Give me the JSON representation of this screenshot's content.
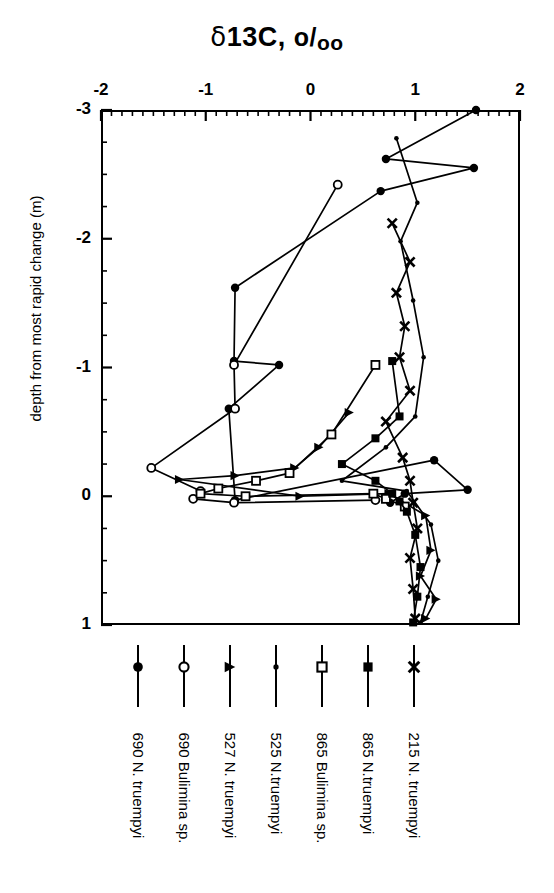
{
  "chart_data": {
    "type": "line",
    "title": "δ13C, o/oo",
    "title_parts": {
      "delta": "δ",
      "main": "13C, ",
      "permil_num": "o",
      "permil_slash": "/",
      "permil_den": "oo"
    },
    "xlabel": "δ13C, o/oo",
    "ylabel": "depth from most rapid change (m)",
    "xlim": [
      -2,
      2
    ],
    "ylim": [
      1,
      -3
    ],
    "x_ticks": [
      -2,
      -1,
      0,
      1,
      2
    ],
    "x_tick_labels": [
      "-2",
      "-1",
      "0",
      "1",
      "2"
    ],
    "x_minor_step": 0.1,
    "y_ticks": [
      -3,
      -2,
      -1,
      0,
      1
    ],
    "y_tick_labels": [
      "-3",
      "-2",
      "-1",
      "0",
      "1"
    ],
    "y_minor_step": 0.25,
    "x_axis_position": "top",
    "grid": false,
    "legend_position": "below",
    "series": [
      {
        "name": "690 N. truempyi",
        "marker": "filled-circle",
        "points": [
          [
            1.58,
            -3.0
          ],
          [
            0.72,
            -2.62
          ],
          [
            1.56,
            -2.55
          ],
          [
            0.67,
            -2.37
          ],
          [
            -0.72,
            -1.62
          ],
          [
            -0.73,
            -1.05
          ],
          [
            -0.3,
            -1.02
          ],
          [
            -0.78,
            -0.68
          ],
          [
            -0.72,
            0.03
          ],
          [
            1.18,
            -0.28
          ],
          [
            1.5,
            -0.05
          ],
          [
            0.9,
            -0.02
          ],
          [
            0.76,
            0.05
          ]
        ]
      },
      {
        "name": "690 Bulimina sp.",
        "marker": "open-circle",
        "points": [
          [
            0.26,
            -2.42
          ],
          [
            -0.73,
            -1.02
          ],
          [
            -0.72,
            -0.68
          ],
          [
            -1.52,
            -0.22
          ],
          [
            -1.05,
            -0.04
          ],
          [
            -1.12,
            0.02
          ],
          [
            -0.73,
            0.05
          ],
          [
            0.62,
            0.03
          ]
        ]
      },
      {
        "name": "527 N. truempyi",
        "marker": "triangle-right",
        "points": [
          [
            0.37,
            -0.65
          ],
          [
            0.08,
            -0.38
          ],
          [
            -0.15,
            -0.22
          ],
          [
            -0.72,
            -0.16
          ],
          [
            -1.25,
            -0.13
          ],
          [
            -0.1,
            0.0
          ],
          [
            0.75,
            -0.02
          ],
          [
            1.1,
            0.15
          ],
          [
            1.15,
            0.42
          ],
          [
            1.05,
            0.62
          ],
          [
            1.2,
            0.8
          ],
          [
            1.1,
            0.95
          ]
        ]
      },
      {
        "name": "525 N.truempyi",
        "marker": "small-dot",
        "points": [
          [
            0.82,
            -2.78
          ],
          [
            1.02,
            -2.28
          ],
          [
            0.86,
            -1.98
          ],
          [
            0.98,
            -1.52
          ],
          [
            1.08,
            -1.08
          ],
          [
            1.0,
            -0.62
          ],
          [
            0.72,
            -0.38
          ],
          [
            0.3,
            -0.12
          ],
          [
            0.92,
            -0.04
          ],
          [
            1.15,
            0.22
          ],
          [
            1.22,
            0.5
          ],
          [
            1.12,
            0.78
          ],
          [
            1.05,
            0.98
          ]
        ]
      },
      {
        "name": "865 Bulimina sp.",
        "marker": "open-square",
        "points": [
          [
            0.62,
            -1.02
          ],
          [
            0.2,
            -0.48
          ],
          [
            -0.2,
            -0.18
          ],
          [
            -0.52,
            -0.12
          ],
          [
            -0.88,
            -0.06
          ],
          [
            -1.05,
            -0.02
          ],
          [
            -0.62,
            0.0
          ],
          [
            0.6,
            -0.02
          ],
          [
            0.72,
            0.02
          ],
          [
            0.9,
            0.08
          ]
        ]
      },
      {
        "name": "865 N.truempyi",
        "marker": "filled-square",
        "points": [
          [
            0.78,
            -1.05
          ],
          [
            0.85,
            -0.62
          ],
          [
            0.62,
            -0.45
          ],
          [
            0.3,
            -0.25
          ],
          [
            0.62,
            -0.12
          ],
          [
            0.78,
            -0.02
          ],
          [
            0.85,
            0.04
          ],
          [
            0.92,
            0.12
          ],
          [
            1.0,
            0.3
          ],
          [
            1.05,
            0.55
          ],
          [
            1.02,
            0.78
          ],
          [
            0.98,
            0.98
          ]
        ]
      },
      {
        "name": "215 N. truempyi",
        "marker": "cross-x",
        "points": [
          [
            0.78,
            -2.12
          ],
          [
            0.95,
            -1.82
          ],
          [
            0.82,
            -1.58
          ],
          [
            0.9,
            -1.32
          ],
          [
            0.85,
            -1.08
          ],
          [
            0.95,
            -0.82
          ],
          [
            0.72,
            -0.58
          ],
          [
            0.88,
            -0.3
          ],
          [
            0.95,
            -0.12
          ],
          [
            0.98,
            0.05
          ],
          [
            1.02,
            0.25
          ],
          [
            0.95,
            0.48
          ],
          [
            0.98,
            0.72
          ],
          [
            1.0,
            0.95
          ]
        ]
      }
    ]
  },
  "legend": {
    "entries": [
      {
        "label": "690 N. truempyi",
        "marker": "filled-circle"
      },
      {
        "label": "690 Bulimina sp.",
        "marker": "open-circle"
      },
      {
        "label": "527 N. truempyi",
        "marker": "triangle-right"
      },
      {
        "label": "525 N.truempyi",
        "marker": "small-dot"
      },
      {
        "label": "865 Bulimina sp.",
        "marker": "open-square"
      },
      {
        "label": "865 N.truempyi",
        "marker": "filled-square"
      },
      {
        "label": "215 N. truempyi",
        "marker": "cross-x"
      }
    ]
  },
  "colors": {
    "ink": "#000000",
    "background": "#ffffff"
  }
}
